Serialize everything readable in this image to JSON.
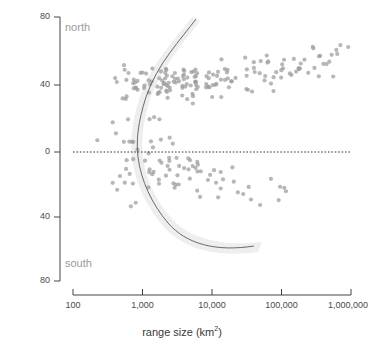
{
  "chart_data": {
    "type": "scatter",
    "title": "",
    "xlabel": "range size (km2)",
    "xlabel_base": "range size (km",
    "xlabel_sup": "2",
    "xlabel_tail": ")",
    "ylabel": "latitude (°)",
    "x_scale": "log10",
    "xlim": [
      100,
      1000000
    ],
    "ylim": [
      -80,
      80
    ],
    "x_ticks": [
      100,
      1000,
      10000,
      100000,
      1000000
    ],
    "x_tick_labels": [
      "100",
      "1,000",
      "10,000",
      "100,000",
      "1,000,000"
    ],
    "y_ticks": [
      80,
      40,
      0,
      -40,
      -80
    ],
    "y_tick_labels": [
      "80",
      "40",
      "0",
      "40",
      "80"
    ],
    "grid": false,
    "legend": "none",
    "annotations": [
      {
        "text": "north",
        "x": 300,
        "y": 68,
        "color": "#9a9a9a"
      },
      {
        "text": "south",
        "x": 300,
        "y": -62,
        "color": "#9a9a9a"
      }
    ],
    "reference_lines": [
      {
        "orientation": "horizontal",
        "value": 0,
        "style": "dotted",
        "color": "#333333"
      }
    ],
    "marker": {
      "shape": "circle",
      "color": "#9b9b9b",
      "opacity": 0.72,
      "size_px": 4.2
    },
    "fit_curve": {
      "name": "quantile fit",
      "color": "#6b6b6b",
      "width_px": 1,
      "band_color": "#e8e8e8",
      "band_opacity": 0.75,
      "description": "C-shaped fit: latitude magnitude grows with range size in both hemispheres"
    },
    "series": [
      {
        "name": "species",
        "points": [
          [
            320,
            11
          ],
          [
            360,
            -13
          ],
          [
            400,
            -12
          ],
          [
            430,
            14
          ],
          [
            450,
            34
          ],
          [
            460,
            8
          ],
          [
            470,
            -12
          ],
          [
            480,
            44
          ],
          [
            500,
            40
          ],
          [
            520,
            39
          ],
          [
            540,
            42
          ],
          [
            560,
            -18
          ],
          [
            580,
            6
          ],
          [
            600,
            10
          ],
          [
            620,
            40
          ],
          [
            640,
            -14
          ],
          [
            660,
            36
          ],
          [
            680,
            -27
          ],
          [
            700,
            43
          ],
          [
            720,
            41
          ],
          [
            760,
            -12
          ],
          [
            800,
            2
          ],
          [
            820,
            44
          ],
          [
            860,
            38
          ],
          [
            900,
            -13
          ],
          [
            950,
            41
          ],
          [
            980,
            -15
          ],
          [
            1000,
            42
          ],
          [
            1050,
            5
          ],
          [
            1100,
            39
          ],
          [
            1150,
            -11
          ],
          [
            1200,
            37
          ],
          [
            1250,
            14
          ],
          [
            1300,
            40
          ],
          [
            1350,
            -13
          ],
          [
            1400,
            41
          ],
          [
            1450,
            12
          ],
          [
            1500,
            38
          ],
          [
            1550,
            -14
          ],
          [
            1600,
            43
          ],
          [
            1650,
            3
          ],
          [
            1700,
            39
          ],
          [
            1750,
            -12
          ],
          [
            1800,
            37
          ],
          [
            1850,
            41
          ],
          [
            1900,
            -13
          ],
          [
            1950,
            35
          ],
          [
            2000,
            40
          ],
          [
            2050,
            5
          ],
          [
            2100,
            42
          ],
          [
            2150,
            -15
          ],
          [
            2200,
            38
          ],
          [
            2250,
            40
          ],
          [
            2300,
            -11
          ],
          [
            2350,
            44
          ],
          [
            2400,
            39
          ],
          [
            2450,
            -14
          ],
          [
            2500,
            41
          ],
          [
            2550,
            37
          ],
          [
            2600,
            2
          ],
          [
            2700,
            43
          ],
          [
            2800,
            -13
          ],
          [
            2900,
            40
          ],
          [
            3000,
            38
          ],
          [
            3100,
            -16
          ],
          [
            3200,
            42
          ],
          [
            3300,
            36
          ],
          [
            3400,
            -12
          ],
          [
            3500,
            41
          ],
          [
            3600,
            39
          ],
          [
            3700,
            -14
          ],
          [
            3800,
            44
          ],
          [
            3900,
            37
          ],
          [
            4000,
            -11
          ],
          [
            4100,
            40
          ],
          [
            4200,
            38
          ],
          [
            4300,
            -18
          ],
          [
            4400,
            43
          ],
          [
            4500,
            36
          ],
          [
            4600,
            -13
          ],
          [
            4700,
            41
          ],
          [
            4800,
            39
          ],
          [
            4900,
            -15
          ],
          [
            5000,
            42
          ],
          [
            5200,
            37
          ],
          [
            5400,
            -17
          ],
          [
            5600,
            40
          ],
          [
            5800,
            44
          ],
          [
            6000,
            -14
          ],
          [
            6200,
            38
          ],
          [
            6400,
            41
          ],
          [
            6600,
            -19
          ],
          [
            6800,
            36
          ],
          [
            7000,
            43
          ],
          [
            7200,
            -16
          ],
          [
            7400,
            39
          ],
          [
            7600,
            42
          ],
          [
            7800,
            -21
          ],
          [
            8000,
            37
          ],
          [
            8500,
            45
          ],
          [
            9000,
            -18
          ],
          [
            9500,
            40
          ],
          [
            10000,
            44
          ],
          [
            10500,
            -20
          ],
          [
            11000,
            38
          ],
          [
            11500,
            46
          ],
          [
            12000,
            -22
          ],
          [
            12500,
            41
          ],
          [
            13000,
            43
          ],
          [
            13500,
            -19
          ],
          [
            14000,
            39
          ],
          [
            15000,
            47
          ],
          [
            16000,
            -24
          ],
          [
            17000,
            42
          ],
          [
            18000,
            45
          ],
          [
            19000,
            -21
          ],
          [
            20000,
            40
          ],
          [
            22000,
            48
          ],
          [
            24000,
            -26
          ],
          [
            26000,
            44
          ],
          [
            28000,
            46
          ],
          [
            30000,
            -23
          ],
          [
            32000,
            41
          ],
          [
            35000,
            50
          ],
          [
            38000,
            -28
          ],
          [
            40000,
            45
          ],
          [
            45000,
            49
          ],
          [
            50000,
            -25
          ],
          [
            55000,
            43
          ],
          [
            60000,
            52
          ],
          [
            65000,
            -30
          ],
          [
            70000,
            47
          ],
          [
            75000,
            51
          ],
          [
            80000,
            -27
          ],
          [
            90000,
            46
          ],
          [
            100000,
            54
          ],
          [
            110000,
            50
          ],
          [
            120000,
            -31
          ],
          [
            130000,
            48
          ],
          [
            140000,
            56
          ],
          [
            150000,
            52
          ],
          [
            160000,
            47
          ],
          [
            180000,
            58
          ],
          [
            200000,
            53
          ],
          [
            220000,
            49
          ],
          [
            250000,
            60
          ],
          [
            280000,
            55
          ],
          [
            300000,
            51
          ],
          [
            350000,
            62
          ],
          [
            400000,
            57
          ],
          [
            450000,
            53
          ],
          [
            500000,
            64
          ],
          [
            550000,
            59
          ],
          [
            600000,
            48
          ],
          [
            700000,
            61
          ],
          [
            800000,
            55
          ]
        ]
      }
    ]
  },
  "canvas": {
    "width": 364,
    "height": 350,
    "background": "#ffffff"
  },
  "axes": {
    "x_label_text": "range size (km",
    "x_label_sup": "2",
    "x_label_close": ")",
    "y_label_text": "latitude (°)",
    "axis_color": "#444444"
  },
  "labels": {
    "north": "north",
    "south": "south"
  },
  "x_tick_labels": {
    "t0": "100",
    "t1": "1,000",
    "t2": "10,000",
    "t3": "100,000",
    "t4": "1,000,000"
  },
  "y_tick_labels": {
    "t0": "80",
    "t1": "40",
    "t2": "0",
    "t3": "40",
    "t4": "80"
  }
}
